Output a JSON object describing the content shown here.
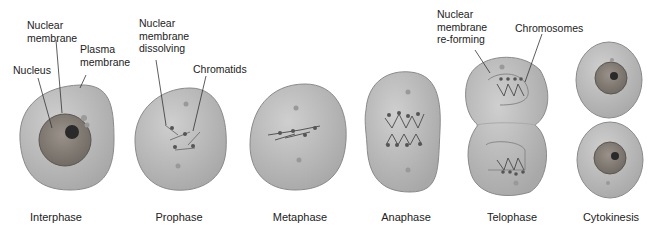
{
  "labels": {
    "nuclear_membrane": "Nuclear\nmembrane",
    "plasma_membrane": "Plasma\nmembrane",
    "nucleus": "Nucleus",
    "nuclear_membrane_dissolving": "Nuclear\nmembrane\ndissolving",
    "chromatids": "Chromatids",
    "nuclear_membrane_reforming": "Nuclear\nmembrane\nre-forming",
    "chromosomes": "Chromosomes"
  },
  "stages": [
    "Interphase",
    "Prophase",
    "Metaphase",
    "Anaphase",
    "Telophase",
    "Cytokinesis"
  ],
  "colors": {
    "cell_fill": "#b4b4b4",
    "cell_edge": "#8a8a8a",
    "nucleus_fill": "#8a8279",
    "nucleolus": "#2a2a2a",
    "line": "#333333"
  }
}
